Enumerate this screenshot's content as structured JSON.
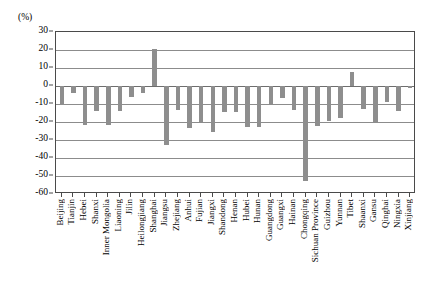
{
  "chart_data": {
    "type": "bar",
    "title": "",
    "xlabel": "",
    "ylabel": "(%)",
    "ylim": [
      -60,
      30
    ],
    "ytick_step": 10,
    "yticks": [
      30,
      20,
      10,
      0,
      -10,
      -20,
      -30,
      -40,
      -50,
      -60
    ],
    "ytick_labels": [
      "30",
      "20",
      "10",
      "0",
      "-10",
      "-20",
      "-30",
      "-40",
      "-50",
      "-60"
    ],
    "grid": true,
    "legend": false,
    "bar_color": "#8e8e8e",
    "categories": [
      "Beijing",
      "Tianjin",
      "Hebei",
      "Shanxi",
      "Inner Mongolia",
      "Liaoning",
      "Jilin",
      "Heilongjiang",
      "Shanghai",
      "Jiangsu",
      "Zhejiang",
      "Anhui",
      "Fujian",
      "Jiangxi",
      "Shandong",
      "Henan",
      "Hubei",
      "Hunan",
      "Guangdong",
      "Guangxi",
      "Hainan",
      "Chongqing",
      "Sichuan Province",
      "Guizhou",
      "Yunnan",
      "Tibet",
      "Shaanxi",
      "Gansu",
      "Qinghai",
      "Ningxia",
      "Xinjiang"
    ],
    "values": [
      -10.5,
      -4.0,
      -21.5,
      -14.0,
      -21.5,
      -14.0,
      -6.0,
      -4.0,
      20.5,
      -33.0,
      -13.5,
      -23.5,
      -20.0,
      -25.5,
      -14.5,
      -14.5,
      -22.5,
      -22.5,
      -10.0,
      -6.5,
      -13.5,
      -52.5,
      -22.0,
      -19.5,
      -18.0,
      8.0,
      -13.0,
      -20.0,
      -9.0,
      -14.0,
      -1.0
    ]
  }
}
